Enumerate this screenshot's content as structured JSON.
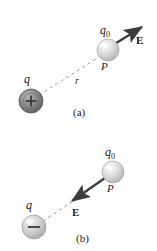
{
  "figure": {
    "background_color": "#ffffff",
    "ink_color": "#1a1a1a",
    "description_alt": "Electric field of a point charge acting on a test charge q0 at point P",
    "panels": [
      {
        "id": "a",
        "caption": "(a)",
        "source_charge": {
          "symbol": "q",
          "sign_glyph": "+",
          "polarity": "positive",
          "fill_color": "#8c8c8c",
          "edge_color": "#4d4d4d",
          "center_x": 31,
          "center_y": 101,
          "radius": 12
        },
        "test_charge": {
          "symbol": "q",
          "subscript": "0",
          "fill_color": "#d9d9d9",
          "edge_color": "#a6a6a6",
          "center_x": 108,
          "center_y": 50,
          "radius": 11
        },
        "point_label": "P",
        "distance_label": "r",
        "field_label": "E",
        "field_direction": "away-from-charge (up-right)",
        "arrow_color": "#3d3d3d",
        "dashed_line_color": "#9a9a9a"
      },
      {
        "id": "b",
        "caption": "(b)",
        "source_charge": {
          "symbol": "q",
          "sign_glyph": "−",
          "polarity": "negative",
          "fill_color": "#d6d6d6",
          "edge_color": "#a0a0a0",
          "center_x": 34,
          "center_y": 227,
          "radius": 12
        },
        "test_charge": {
          "symbol": "q",
          "subscript": "0",
          "fill_color": "#d9d9d9",
          "edge_color": "#a6a6a6",
          "center_x": 113,
          "center_y": 172,
          "radius": 11
        },
        "point_label": "P",
        "distance_label": "",
        "field_label": "E",
        "field_direction": "toward-charge (down-left)",
        "arrow_color": "#3d3d3d",
        "dashed_line_color": "#9a9a9a"
      }
    ]
  }
}
